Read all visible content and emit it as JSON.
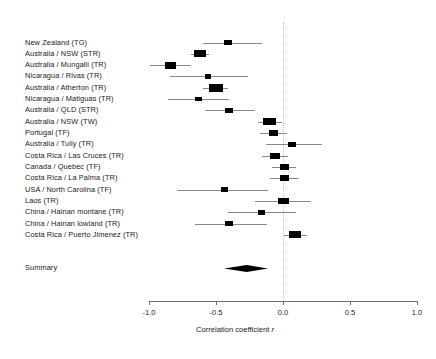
{
  "chart_data": {
    "type": "forest",
    "title": "",
    "xlabel": "Correlation coefficient r",
    "ylabel": "",
    "xlim": [
      -1.0,
      1.0
    ],
    "xticks": [
      "-1.0",
      "-0.5",
      "0.0",
      "0.5",
      "1.0"
    ],
    "xtick_values": [
      -1.0,
      -0.5,
      0.0,
      0.5,
      1.0
    ],
    "grid": false,
    "reference_line": 0.0,
    "legend": "none",
    "categories": [
      "New Zealand (TG)",
      "Australia / NSW (STR)",
      "Australia / Mungalli (TR)",
      "Nicaragua / Rivas (TR)",
      "Australia / Atherton (TR)",
      "Nicaragua / Matiguas (TR)",
      "Australia / QLD (STR)",
      "Australia / NSW (TW)",
      "Portugal (TF)",
      "Australia / Tully (TR)",
      "Costa Rica / Las Cruces (TR)",
      "Canada / Quebec (TF)",
      "Costa Rica / La Palma (TR)",
      "USA / North Carolina (TF)",
      "Laos (TR)",
      "China / Hainan montane (TR)",
      "China / Hainan lowland (TR)",
      "Costa Rica / Puerto Jimenez (TR)"
    ],
    "values": [
      -0.41,
      -0.62,
      -0.84,
      -0.56,
      -0.5,
      -0.63,
      -0.4,
      -0.1,
      -0.07,
      0.07,
      -0.06,
      0.01,
      0.01,
      -0.44,
      0.0,
      -0.16,
      -0.4,
      0.09
    ],
    "ci_low": [
      -0.6,
      -0.69,
      -0.99,
      -0.84,
      -0.6,
      -0.86,
      -0.58,
      -0.19,
      -0.17,
      -0.13,
      -0.16,
      -0.08,
      -0.1,
      -0.79,
      -0.21,
      -0.41,
      -0.66,
      0.01
    ],
    "ci_high": [
      -0.16,
      -0.55,
      -0.69,
      -0.26,
      -0.41,
      -0.4,
      -0.21,
      -0.01,
      0.03,
      0.29,
      0.04,
      0.1,
      0.12,
      -0.11,
      0.21,
      0.1,
      -0.12,
      0.18
    ],
    "weights": [
      0.35,
      0.8,
      0.75,
      0.25,
      0.95,
      0.3,
      0.4,
      0.85,
      0.45,
      0.38,
      0.62,
      0.45,
      0.55,
      0.3,
      0.7,
      0.36,
      0.42,
      0.78
    ],
    "summary": {
      "label": "Summary",
      "value": -0.27,
      "ci_low": -0.44,
      "ci_high": -0.11
    }
  },
  "axis": {
    "title": "Correlation coefficient ",
    "title_italic": "r"
  }
}
